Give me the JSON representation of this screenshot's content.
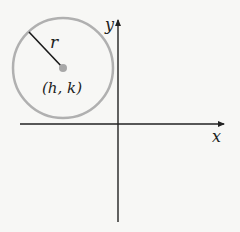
{
  "figure": {
    "circle": {
      "cx": 63,
      "cy": 68,
      "r": 50,
      "stroke": "#b0b0b0",
      "center_fill": "#a8a8a8"
    },
    "labels": {
      "radius": "r",
      "center": "(h, k)",
      "x_axis": "x",
      "y_axis": "y"
    },
    "colors": {
      "axis": "#222222",
      "background": "#f7f7f5",
      "radius_line": "#1a1a1a"
    }
  }
}
